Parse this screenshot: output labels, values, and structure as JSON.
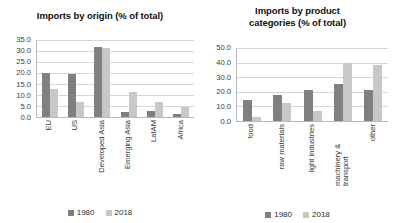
{
  "legend": {
    "series": [
      {
        "name": "1980",
        "color": "#808080"
      },
      {
        "name": "2018",
        "color": "#c8c8c8"
      }
    ]
  },
  "chart_data": [
    {
      "type": "bar",
      "title": "Imports by origin (% of total)",
      "xlabel": "",
      "ylabel": "",
      "ylim": [
        0,
        35
      ],
      "yticks": [
        "0.0",
        "5.0",
        "10.0",
        "15.0",
        "20.0",
        "25.0",
        "30.0",
        "35.0"
      ],
      "grid": true,
      "legend_position": "bottom",
      "categories": [
        "EU",
        "US",
        "Developed Asia",
        "Emerging Asia",
        "LatAM",
        "Africa"
      ],
      "series": [
        {
          "name": "1980",
          "color": "#808080",
          "values": [
            20.0,
            19.7,
            32.0,
            2.4,
            2.6,
            1.2
          ]
        },
        {
          "name": "2018",
          "color": "#c8c8c8",
          "values": [
            12.7,
            7.0,
            31.2,
            11.5,
            6.6,
            4.5
          ]
        }
      ]
    },
    {
      "type": "bar",
      "title": "Imports by product categories (% of total)",
      "title_lines": [
        "Imports by product",
        "categories (% of total)"
      ],
      "xlabel": "",
      "ylabel": "",
      "ylim": [
        0,
        50
      ],
      "yticks": [
        "0.0",
        "10.0",
        "20.0",
        "30.0",
        "40.0",
        "50.0"
      ],
      "grid": true,
      "legend_position": "bottom",
      "categories": [
        "food",
        "raw materials",
        "light industries",
        "machinery & transport",
        "other"
      ],
      "series": [
        {
          "name": "1980",
          "color": "#808080",
          "values": [
            14.5,
            17.8,
            21.0,
            25.5,
            21.3
          ]
        },
        {
          "name": "2018",
          "color": "#c8c8c8",
          "values": [
            3.0,
            12.6,
            7.2,
            40.0,
            38.2
          ]
        }
      ]
    }
  ]
}
